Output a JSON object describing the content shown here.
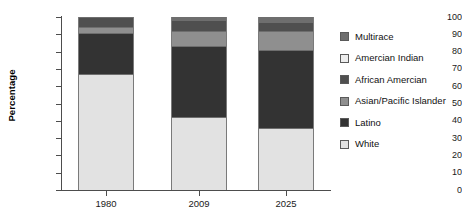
{
  "chart_data": {
    "type": "bar",
    "subtype": "stacked-percentage",
    "title": "",
    "xlabel": "",
    "ylabel": "Percentage",
    "categories": [
      "1980",
      "2009",
      "2025"
    ],
    "ylim": [
      0,
      100
    ],
    "ytick_labels": [
      "0",
      "10",
      "20",
      "30",
      "40",
      "50",
      "60",
      "70",
      "80",
      "90",
      "100"
    ],
    "ytick_values": [
      0,
      10,
      20,
      30,
      40,
      50,
      60,
      70,
      80,
      90,
      100
    ],
    "grid": false,
    "legend_position": "right",
    "stack_order_bottom_to_top": [
      "White",
      "Latino",
      "Asian/Pacific Islander",
      "African Amercian",
      "Amercian Indian",
      "Multirace"
    ],
    "series": [
      {
        "name": "White",
        "values": [
          67,
          42,
          36
        ],
        "color": "#e2e2e2"
      },
      {
        "name": "Latino",
        "values": [
          24,
          41,
          45
        ],
        "color": "#333333"
      },
      {
        "name": "Asian/Pacific Islander",
        "values": [
          3,
          9,
          11
        ],
        "color": "#8f8f8f"
      },
      {
        "name": "African Amercian",
        "values": [
          6,
          6,
          5
        ],
        "color": "#4f4f4f"
      },
      {
        "name": "Amercian Indian",
        "values": [
          0,
          0,
          0
        ],
        "color": "#ededed"
      },
      {
        "name": "Multirace",
        "values": [
          0,
          2,
          3
        ],
        "color": "#6e6e6e"
      }
    ]
  },
  "legend": {
    "items": [
      {
        "label": "Multirace",
        "color": "#6e6e6e"
      },
      {
        "label": "Amercian Indian",
        "color": "#ededed"
      },
      {
        "label": "African Amercian",
        "color": "#4f4f4f"
      },
      {
        "label": "Asian/Pacific Islander",
        "color": "#8f8f8f"
      },
      {
        "label": "Latino",
        "color": "#333333"
      },
      {
        "label": "White",
        "color": "#e2e2e2"
      }
    ]
  }
}
